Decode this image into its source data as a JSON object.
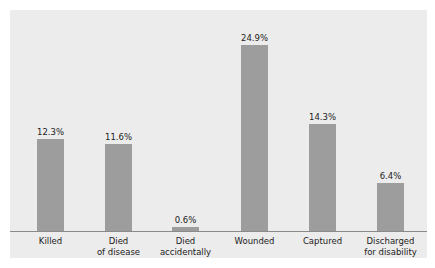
{
  "chart_data": {
    "type": "bar",
    "title": "",
    "xlabel": "",
    "ylabel": "",
    "categories": [
      "Killed",
      "Died\nof disease",
      "Died\naccidentally",
      "Wounded",
      "Captured",
      "Discharged\nfor disability"
    ],
    "values": [
      12.3,
      11.6,
      0.6,
      24.9,
      14.3,
      6.4
    ],
    "value_labels": [
      "12.3%",
      "11.6%",
      "0.6%",
      "24.9%",
      "14.3%",
      "6.4%"
    ],
    "unit": "%",
    "ylim": [
      0,
      27
    ],
    "grid": false,
    "legend": null,
    "colors": {
      "bar": "#9d9d9d",
      "background": "#ececec",
      "axis": "#8a8a8a"
    }
  }
}
